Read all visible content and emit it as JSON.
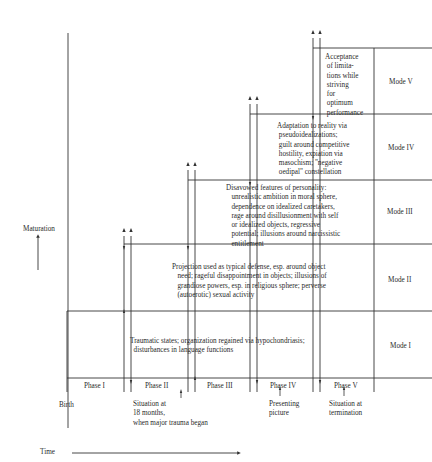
{
  "axes": {
    "vertical_label": "Maturation",
    "horizontal_label": "Time"
  },
  "modes": [
    {
      "id": "mode-1",
      "label": "Mode I",
      "text": "Traumatic states; organization regained via hypochondriasis;\n  disturbances in language functions"
    },
    {
      "id": "mode-2",
      "label": "Mode II",
      "text": "Projection used as typical defense, esp. around object\n   need; rageful disappointment in objects; illusions of\n   grandiose powers, esp. in religious sphere; perverse\n   (autoerotic) sexual activity"
    },
    {
      "id": "mode-3",
      "label": "Mode III",
      "text": "Disavowed features of personality:\n   unrealistic ambition in moral sphere,\n   dependence on idealized caretakers,\n   rage around disillusionment with self\n   or idealized objects, regressive\n   potential; illusions around narcissistic\n   entitlement"
    },
    {
      "id": "mode-4",
      "label": "Mode IV",
      "text": "Adaptation to reality via\n pseudoidealizations;\n guilt around competitive\n hostility, expiation via\n masochism; \"negative\n oedipal\" constellation"
    },
    {
      "id": "mode-5",
      "label": "Mode V",
      "text": "Acceptance\n of limita-\n tions while\n striving\n for\n optimum\n performance"
    }
  ],
  "phases": [
    "Phase I",
    "Phase II",
    "Phase III",
    "Phase IV",
    "Phase V"
  ],
  "timeline_annotations": {
    "birth": "Birth",
    "situation_18_months": "Situation at\n18 months,\nwhen major trauma began",
    "presenting_picture": "Presenting\npicture",
    "situation_termination": "Situation at\ntermination"
  }
}
